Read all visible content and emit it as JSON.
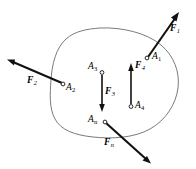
{
  "figure": {
    "background_color": "#ffffff",
    "outline_color": "#6b6b6b",
    "vector_color": "#111111",
    "width": 196,
    "height": 169
  },
  "body": {
    "name": "rigid-body-outline",
    "shape": "irregular closed curve"
  },
  "forces": [
    {
      "id": "F1",
      "label_base": "F",
      "label_sub": "1",
      "point_base": "A",
      "point_sub": "1",
      "direction": "up-right",
      "tail_x": 148,
      "tail_y": 57,
      "tip_x": 179,
      "tip_y": 13,
      "label_x": 170,
      "label_y": 29,
      "point_x": 147,
      "point_y": 58,
      "point_label_x": 153,
      "point_label_y": 55
    },
    {
      "id": "F2",
      "label_base": "F",
      "label_sub": "2",
      "point_base": "A",
      "point_sub": "2",
      "direction": "up-left",
      "tail_x": 62,
      "tail_y": 83,
      "tip_x": 8,
      "tip_y": 60,
      "label_x": 30,
      "label_y": 81,
      "point_x": 63,
      "point_y": 84,
      "point_label_x": 66,
      "point_label_y": 85
    },
    {
      "id": "F3",
      "label_base": "F",
      "label_sub": "3",
      "point_base": "A",
      "point_sub": "3",
      "direction": "down",
      "tail_x": 102,
      "tail_y": 74,
      "tip_x": 102,
      "tip_y": 112,
      "label_x": 105,
      "label_y": 92,
      "point_x": 102,
      "point_y": 72,
      "point_label_x": 88,
      "point_label_y": 66
    },
    {
      "id": "F4",
      "label_base": "F",
      "label_sub": "4",
      "point_base": "A",
      "point_sub": "4",
      "direction": "up",
      "tail_x": 131,
      "tail_y": 105,
      "tip_x": 131,
      "tip_y": 63,
      "label_x": 134,
      "label_y": 66,
      "point_x": 131,
      "point_y": 107,
      "point_label_x": 135,
      "point_label_y": 104
    },
    {
      "id": "Fn",
      "label_base": "F",
      "label_sub": "n",
      "point_base": "A",
      "point_sub": "n",
      "direction": "down-right",
      "tail_x": 106,
      "tail_y": 123,
      "tip_x": 150,
      "tip_y": 163,
      "label_x": 105,
      "label_y": 143,
      "point_x": 105,
      "point_y": 122,
      "point_label_x": 88,
      "point_label_y": 119
    }
  ]
}
